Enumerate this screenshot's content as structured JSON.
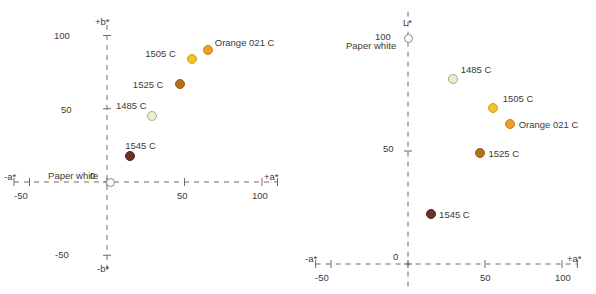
{
  "figure": {
    "background": "#ffffff",
    "text_color": "#3e3a38",
    "axis_color": "#6f6a68"
  },
  "chart_data": [
    {
      "id": "ab-plane",
      "type": "scatter",
      "title": "",
      "xlabel": "+a*",
      "xlabel_negative": "-a*",
      "ylabel": "+b*",
      "ylabel_negative": "-b*",
      "xlim": [
        -60,
        110
      ],
      "ylim": [
        -60,
        110
      ],
      "xticks": [
        -50,
        0,
        50,
        100
      ],
      "xticklabels": [
        "-50",
        "0",
        "50",
        "100"
      ],
      "yticks": [
        -50,
        0,
        50,
        100
      ],
      "yticklabels": [
        "-50",
        "0",
        "50",
        "100"
      ],
      "grid": false,
      "axis_style": "dashed-cross",
      "points": [
        {
          "label": "Orange 021 C",
          "x": 65,
          "y": 90,
          "color": "#eda028",
          "edge": "#c98119",
          "r": 5.0,
          "label_dx": 7,
          "label_dy": -13
        },
        {
          "label": "1505 C",
          "x": 55,
          "y": 84,
          "color": "#f2c327",
          "edge": "#cda11c",
          "r": 5.0,
          "label_dx": -47,
          "label_dy": -11
        },
        {
          "label": "1525 C",
          "x": 47,
          "y": 67,
          "color": "#b4701c",
          "edge": "#925a14",
          "r": 5.0,
          "label_dx": -47,
          "label_dy": -5
        },
        {
          "label": "1485 C",
          "x": 29,
          "y": 45,
          "color": "#eeedd2",
          "edge": "#a9a882",
          "r": 5.0,
          "label_dx": -36,
          "label_dy": -16
        },
        {
          "label": "1545 C",
          "x": 15,
          "y": 18,
          "color": "#6e3229",
          "edge": "#512019",
          "r": 5.0,
          "label_dx": -5,
          "label_dy": -16
        },
        {
          "label": "Paper white",
          "x": 2,
          "y": 0,
          "color": "#ffffff",
          "edge": "#8d8a88",
          "r": 4.5,
          "label_dx": -62,
          "label_dy": -12
        }
      ]
    },
    {
      "id": "L-a-plane",
      "type": "scatter",
      "title": "",
      "xlabel": "+a*",
      "xlabel_negative": "-a*",
      "ylabel": "L*",
      "xlim": [
        -60,
        110
      ],
      "ylim": [
        -10,
        112
      ],
      "xticks": [
        -50,
        0,
        50,
        100
      ],
      "xticklabels": [
        "-50",
        "0",
        "50",
        "100"
      ],
      "yticks": [
        0,
        50,
        100
      ],
      "yticklabels": [
        "0",
        "50",
        "100"
      ],
      "grid": false,
      "axis_style": "dashed-cross",
      "points": [
        {
          "label": "Paper white",
          "x": 0,
          "y": 100,
          "color": "#ffffff",
          "edge": "#8d8a88",
          "r": 4.5,
          "label_dx": -62,
          "label_dy": 2
        },
        {
          "label": "1485 C",
          "x": 29,
          "y": 82,
          "color": "#eeedd2",
          "edge": "#a9a882",
          "r": 5.0,
          "label_dx": 8,
          "label_dy": -15
        },
        {
          "label": "1505 C",
          "x": 55,
          "y": 69,
          "color": "#f2c327",
          "edge": "#cda11c",
          "r": 5.0,
          "label_dx": 10,
          "label_dy": -15
        },
        {
          "label": "Orange 021 C",
          "x": 66,
          "y": 62,
          "color": "#eda028",
          "edge": "#c98119",
          "r": 5.0,
          "label_dx": 9,
          "label_dy": -5
        },
        {
          "label": "1525 C",
          "x": 47,
          "y": 49,
          "color": "#b4701c",
          "edge": "#925a14",
          "r": 5.0,
          "label_dx": 8,
          "label_dy": -5
        },
        {
          "label": "1545 C",
          "x": 15,
          "y": 22,
          "color": "#6e3229",
          "edge": "#512019",
          "r": 5.0,
          "label_dx": 8,
          "label_dy": -5
        }
      ]
    }
  ],
  "left_chart": {
    "name": "a-b chromaticity plot",
    "axis_top_label": "+b*",
    "axis_bottom_label": "-b*",
    "axis_left_label": "-a*",
    "axis_right_label": "+a*",
    "tick_y_100": "100",
    "tick_y_50": "50",
    "tick_y_0": "0",
    "tick_y_neg50": "-50",
    "tick_x_neg50": "-50",
    "tick_x_50": "50",
    "tick_x_100": "100"
  },
  "right_chart": {
    "name": "L-a lightness plot",
    "axis_top_label": "L*",
    "axis_left_label": "-a*",
    "axis_right_label": "+a*",
    "tick_y_100": "100",
    "tick_y_50": "50",
    "tick_y_0": "0",
    "tick_x_neg50": "-50",
    "tick_x_50": "50",
    "tick_x_100": "100"
  }
}
